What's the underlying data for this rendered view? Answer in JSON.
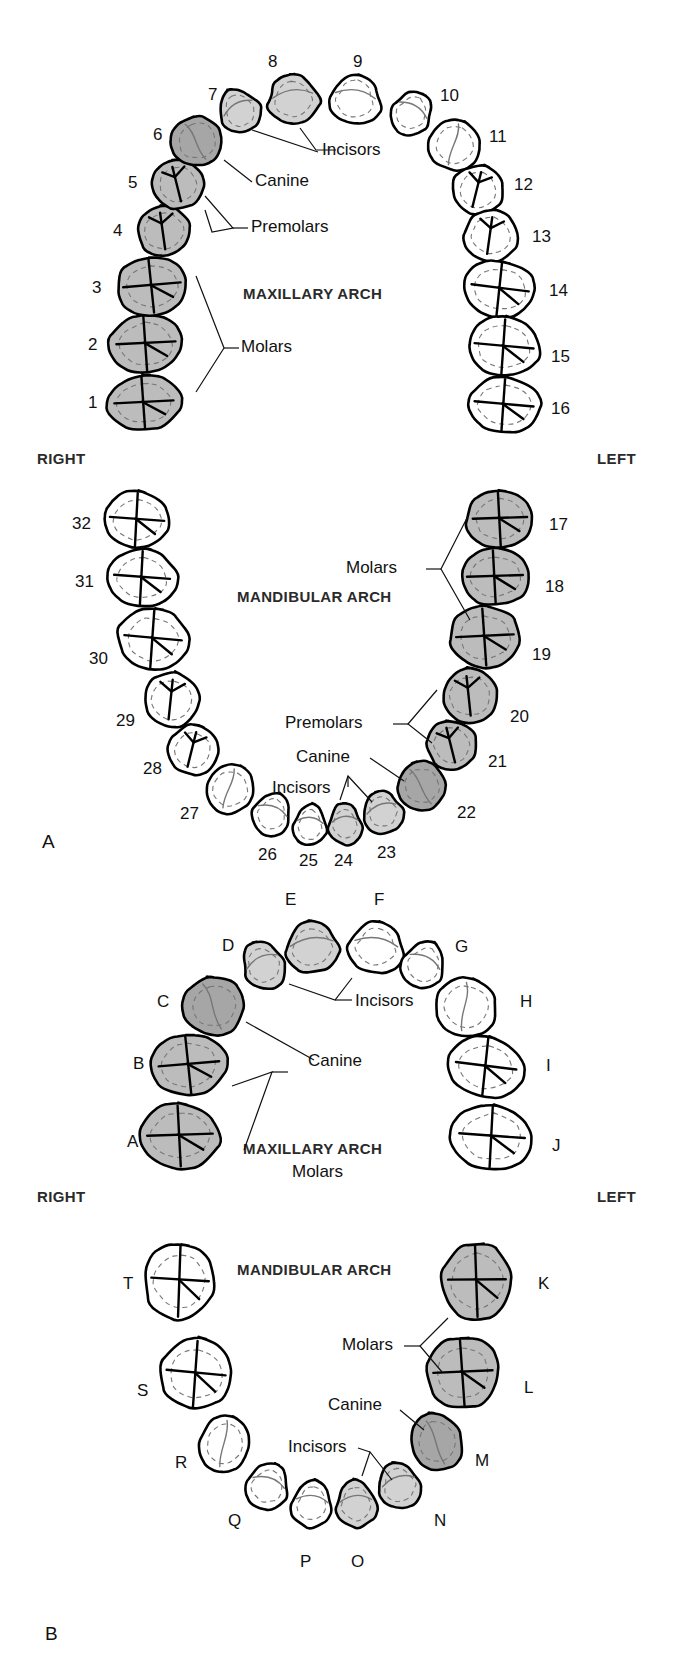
{
  "figure": {
    "panels": [
      {
        "id": "A",
        "letter": "A",
        "caption": "Permanent dentition"
      },
      {
        "id": "B",
        "letter": "B",
        "caption": "Primary dentition"
      }
    ]
  },
  "colors": {
    "outline": "#000000",
    "incisor_fill": "#d2d2d2",
    "canine_fill": "#a6a6a6",
    "posterior_fill": "#bcbcbc",
    "unshaded_fill": "#ffffff",
    "detail_line": "#777777",
    "text": "#111111",
    "heading_text": "#2a2a2a"
  },
  "panelA": {
    "letter": "A",
    "maxillary": {
      "arch_title": "MAXILLARY ARCH",
      "right_label": "RIGHT",
      "left_label": "LEFT",
      "callouts": [
        "Incisors",
        "Canine",
        "Premolars",
        "Molars"
      ],
      "teeth": [
        {
          "num": "1",
          "type": "molar",
          "shaded": true,
          "cx": 144,
          "cy": 403,
          "w": 74,
          "h": 56,
          "rot": -4,
          "lx": 88,
          "ly": 394
        },
        {
          "num": "2",
          "type": "molar",
          "shaded": true,
          "cx": 146,
          "cy": 344,
          "w": 74,
          "h": 60,
          "rot": -4,
          "lx": 88,
          "ly": 336
        },
        {
          "num": "3",
          "type": "molar",
          "shaded": true,
          "cx": 152,
          "cy": 286,
          "w": 72,
          "h": 58,
          "rot": -6,
          "lx": 92,
          "ly": 279
        },
        {
          "num": "4",
          "type": "premolar",
          "shaded": true,
          "cx": 164,
          "cy": 231,
          "w": 54,
          "h": 52,
          "rot": -8,
          "lx": 113,
          "ly": 222
        },
        {
          "num": "5",
          "type": "premolar",
          "shaded": true,
          "cx": 178,
          "cy": 184,
          "w": 52,
          "h": 50,
          "rot": -14,
          "lx": 128,
          "ly": 174
        },
        {
          "num": "6",
          "type": "canine",
          "shaded": true,
          "cx": 197,
          "cy": 141,
          "w": 52,
          "h": 50,
          "rot": -22,
          "lx": 153,
          "ly": 126
        },
        {
          "num": "7",
          "type": "incisor",
          "shaded": true,
          "cx": 239,
          "cy": 110,
          "w": 44,
          "h": 48,
          "rot": -30,
          "lx": 208,
          "ly": 86
        },
        {
          "num": "8",
          "type": "incisor",
          "shaded": true,
          "cx": 293,
          "cy": 98,
          "w": 56,
          "h": 54,
          "rot": -8,
          "lx": 268,
          "ly": 53
        },
        {
          "num": "9",
          "type": "incisor",
          "shaded": false,
          "cx": 355,
          "cy": 98,
          "w": 56,
          "h": 54,
          "rot": 8,
          "lx": 353,
          "ly": 53
        },
        {
          "num": "10",
          "type": "incisor",
          "shaded": false,
          "cx": 412,
          "cy": 112,
          "w": 44,
          "h": 48,
          "rot": 30,
          "lx": 440,
          "ly": 87
        },
        {
          "num": "11",
          "type": "canine",
          "shaded": false,
          "cx": 455,
          "cy": 145,
          "w": 52,
          "h": 52,
          "rot": 22,
          "lx": 489,
          "ly": 128
        },
        {
          "num": "12",
          "type": "premolar",
          "shaded": false,
          "cx": 478,
          "cy": 190,
          "w": 52,
          "h": 50,
          "rot": 14,
          "lx": 514,
          "ly": 176
        },
        {
          "num": "13",
          "type": "premolar",
          "shaded": false,
          "cx": 491,
          "cy": 236,
          "w": 54,
          "h": 52,
          "rot": 8,
          "lx": 532,
          "ly": 228
        },
        {
          "num": "14",
          "type": "molar",
          "shaded": false,
          "cx": 500,
          "cy": 289,
          "w": 72,
          "h": 58,
          "rot": 6,
          "lx": 549,
          "ly": 282
        },
        {
          "num": "15",
          "type": "molar",
          "shaded": false,
          "cx": 504,
          "cy": 347,
          "w": 74,
          "h": 60,
          "rot": 4,
          "lx": 551,
          "ly": 348
        },
        {
          "num": "16",
          "type": "molar",
          "shaded": false,
          "cx": 504,
          "cy": 405,
          "w": 74,
          "h": 56,
          "rot": 4,
          "lx": 551,
          "ly": 400
        }
      ]
    },
    "mandibular": {
      "arch_title": "MANDIBULAR ARCH",
      "callouts": [
        "Molars",
        "Premolars",
        "Canine",
        "Incisors"
      ],
      "teeth": [
        {
          "num": "32",
          "type": "molar",
          "shaded": false,
          "cx": 137,
          "cy": 520,
          "w": 68,
          "h": 58,
          "rot": 3,
          "lx": 72,
          "ly": 515
        },
        {
          "num": "31",
          "type": "molar",
          "shaded": false,
          "cx": 142,
          "cy": 578,
          "w": 70,
          "h": 58,
          "rot": 3,
          "lx": 75,
          "ly": 573
        },
        {
          "num": "30",
          "type": "molar",
          "shaded": false,
          "cx": 153,
          "cy": 639,
          "w": 72,
          "h": 62,
          "rot": 4,
          "lx": 89,
          "ly": 650
        },
        {
          "num": "29",
          "type": "premolar",
          "shaded": false,
          "cx": 172,
          "cy": 700,
          "w": 56,
          "h": 56,
          "rot": 6,
          "lx": 116,
          "ly": 712
        },
        {
          "num": "28",
          "type": "premolar",
          "shaded": false,
          "cx": 193,
          "cy": 750,
          "w": 50,
          "h": 50,
          "rot": 14,
          "lx": 143,
          "ly": 760
        },
        {
          "num": "27",
          "type": "canine",
          "shaded": false,
          "cx": 230,
          "cy": 789,
          "w": 48,
          "h": 50,
          "rot": 24,
          "lx": 180,
          "ly": 805
        },
        {
          "num": "26",
          "type": "incisor",
          "shaded": false,
          "cx": 272,
          "cy": 813,
          "w": 42,
          "h": 46,
          "rot": 20,
          "lx": 258,
          "ly": 846
        },
        {
          "num": "25",
          "type": "incisor",
          "shaded": false,
          "cx": 310,
          "cy": 824,
          "w": 36,
          "h": 44,
          "rot": 6,
          "lx": 299,
          "ly": 852
        },
        {
          "num": "24",
          "type": "incisor",
          "shaded": true,
          "cx": 345,
          "cy": 823,
          "w": 36,
          "h": 44,
          "rot": -6,
          "lx": 334,
          "ly": 852
        },
        {
          "num": "23",
          "type": "incisor",
          "shaded": true,
          "cx": 382,
          "cy": 811,
          "w": 42,
          "h": 46,
          "rot": -20,
          "lx": 377,
          "ly": 844
        },
        {
          "num": "22",
          "type": "canine",
          "shaded": true,
          "cx": 422,
          "cy": 786,
          "w": 48,
          "h": 50,
          "rot": -24,
          "lx": 457,
          "ly": 804
        },
        {
          "num": "21",
          "type": "premolar",
          "shaded": true,
          "cx": 452,
          "cy": 745,
          "w": 50,
          "h": 50,
          "rot": -14,
          "lx": 488,
          "ly": 753
        },
        {
          "num": "20",
          "type": "premolar",
          "shaded": true,
          "cx": 470,
          "cy": 696,
          "w": 56,
          "h": 56,
          "rot": -6,
          "lx": 510,
          "ly": 708
        },
        {
          "num": "19",
          "type": "molar",
          "shaded": true,
          "cx": 485,
          "cy": 637,
          "w": 72,
          "h": 62,
          "rot": -4,
          "lx": 532,
          "ly": 646
        },
        {
          "num": "18",
          "type": "molar",
          "shaded": true,
          "cx": 495,
          "cy": 577,
          "w": 70,
          "h": 58,
          "rot": -3,
          "lx": 545,
          "ly": 578
        },
        {
          "num": "17",
          "type": "molar",
          "shaded": true,
          "cx": 500,
          "cy": 519,
          "w": 68,
          "h": 58,
          "rot": -3,
          "lx": 549,
          "ly": 516
        }
      ]
    }
  },
  "panelB": {
    "letter": "B",
    "maxillary": {
      "arch_title": "MAXILLARY ARCH",
      "right_label": "RIGHT",
      "left_label": "LEFT",
      "callouts": [
        "Incisors",
        "Canine",
        "Molars"
      ],
      "teeth": [
        {
          "num": "A",
          "type": "molar",
          "shaded": true,
          "cx": 180,
          "cy": 1136,
          "w": 82,
          "h": 66,
          "rot": -3,
          "lx": 127,
          "ly": 1133
        },
        {
          "num": "B",
          "type": "molar",
          "shaded": true,
          "cx": 189,
          "cy": 1065,
          "w": 76,
          "h": 62,
          "rot": -6,
          "lx": 133,
          "ly": 1055
        },
        {
          "num": "C",
          "type": "canine",
          "shaded": true,
          "cx": 214,
          "cy": 1006,
          "w": 62,
          "h": 60,
          "rot": -14,
          "lx": 157,
          "ly": 993
        },
        {
          "num": "D",
          "type": "incisor",
          "shaded": true,
          "cx": 263,
          "cy": 964,
          "w": 46,
          "h": 52,
          "rot": -26,
          "lx": 222,
          "ly": 937
        },
        {
          "num": "E",
          "type": "incisor",
          "shaded": true,
          "cx": 312,
          "cy": 946,
          "w": 60,
          "h": 54,
          "rot": -8,
          "lx": 285,
          "ly": 891
        },
        {
          "num": "F",
          "type": "incisor",
          "shaded": false,
          "cx": 376,
          "cy": 946,
          "w": 60,
          "h": 54,
          "rot": 8,
          "lx": 374,
          "ly": 891
        },
        {
          "num": "G",
          "type": "incisor",
          "shaded": false,
          "cx": 424,
          "cy": 964,
          "w": 46,
          "h": 52,
          "rot": 26,
          "lx": 455,
          "ly": 938
        },
        {
          "num": "H",
          "type": "canine",
          "shaded": false,
          "cx": 466,
          "cy": 1007,
          "w": 62,
          "h": 60,
          "rot": 14,
          "lx": 520,
          "ly": 993
        },
        {
          "num": "I",
          "type": "molar",
          "shaded": false,
          "cx": 486,
          "cy": 1067,
          "w": 76,
          "h": 62,
          "rot": 6,
          "lx": 546,
          "ly": 1057
        },
        {
          "num": "J",
          "type": "molar",
          "shaded": false,
          "cx": 492,
          "cy": 1137,
          "w": 82,
          "h": 66,
          "rot": 3,
          "lx": 552,
          "ly": 1137
        }
      ]
    },
    "mandibular": {
      "arch_title": "MANDIBULAR ARCH",
      "callouts": [
        "Molars",
        "Canine",
        "Incisors"
      ],
      "teeth": [
        {
          "num": "T",
          "type": "molar",
          "shaded": false,
          "cx": 180,
          "cy": 1281,
          "w": 72,
          "h": 78,
          "rot": 2,
          "lx": 123,
          "ly": 1275
        },
        {
          "num": "S",
          "type": "molar",
          "shaded": false,
          "cx": 196,
          "cy": 1374,
          "w": 74,
          "h": 72,
          "rot": 4,
          "lx": 137,
          "ly": 1382
        },
        {
          "num": "R",
          "type": "canine",
          "shaded": false,
          "cx": 225,
          "cy": 1444,
          "w": 50,
          "h": 58,
          "rot": 16,
          "lx": 175,
          "ly": 1454
        },
        {
          "num": "Q",
          "type": "incisor",
          "shaded": false,
          "cx": 268,
          "cy": 1485,
          "w": 46,
          "h": 50,
          "rot": 18,
          "lx": 228,
          "ly": 1512
        },
        {
          "num": "P",
          "type": "incisor",
          "shaded": false,
          "cx": 312,
          "cy": 1503,
          "w": 44,
          "h": 50,
          "rot": 6,
          "lx": 300,
          "ly": 1553
        },
        {
          "num": "O",
          "type": "incisor",
          "shaded": true,
          "cx": 356,
          "cy": 1503,
          "w": 44,
          "h": 50,
          "rot": -6,
          "lx": 351,
          "ly": 1553
        },
        {
          "num": "N",
          "type": "incisor",
          "shaded": true,
          "cx": 399,
          "cy": 1484,
          "w": 46,
          "h": 50,
          "rot": -18,
          "lx": 434,
          "ly": 1512
        },
        {
          "num": "M",
          "type": "canine",
          "shaded": true,
          "cx": 437,
          "cy": 1442,
          "w": 50,
          "h": 58,
          "rot": -16,
          "lx": 475,
          "ly": 1452
        },
        {
          "num": "L",
          "type": "molar",
          "shaded": true,
          "cx": 463,
          "cy": 1373,
          "w": 74,
          "h": 72,
          "rot": -4,
          "lx": 524,
          "ly": 1379
        },
        {
          "num": "K",
          "type": "molar",
          "shaded": true,
          "cx": 477,
          "cy": 1281,
          "w": 72,
          "h": 78,
          "rot": -2,
          "lx": 538,
          "ly": 1275
        }
      ]
    }
  },
  "callout_text": {
    "a_max_incisors": "Incisors",
    "a_max_canine": "Canine",
    "a_max_premolars": "Premolars",
    "a_max_molars": "Molars",
    "a_man_molars": "Molars",
    "a_man_premolars": "Premolars",
    "a_man_canine": "Canine",
    "a_man_incisors": "Incisors",
    "b_max_incisors": "Incisors",
    "b_max_canine": "Canine",
    "b_max_molars": "Molars",
    "b_man_molars": "Molars",
    "b_man_canine": "Canine",
    "b_man_incisors": "Incisors"
  }
}
